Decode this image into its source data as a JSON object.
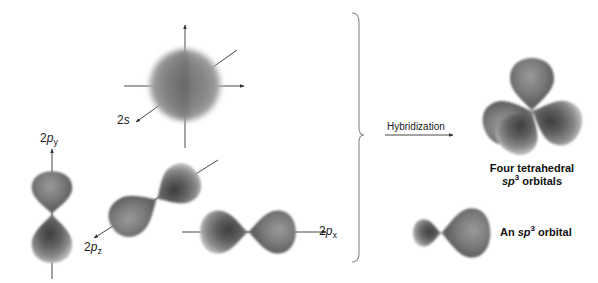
{
  "diagram": {
    "type": "orbital-hybridization",
    "colors": {
      "orbital_dark": "#4a4a4a",
      "orbital_mid": "#7a7a7a",
      "orbital_light": "#b5b5b5",
      "axis_line": "#333333",
      "brace": "#8a8a8a",
      "text": "#1a1a1a"
    },
    "left_group": {
      "orbitals": [
        {
          "id": "2s",
          "shape": "sphere",
          "label_main": "2",
          "label_italic": "s",
          "label_sub": ""
        },
        {
          "id": "2py",
          "shape": "dumbbell-vertical",
          "label_main": "2",
          "label_italic": "p",
          "label_sub": "y"
        },
        {
          "id": "2pz",
          "shape": "dumbbell-diagonal",
          "label_main": "2",
          "label_italic": "p",
          "label_sub": "z"
        },
        {
          "id": "2px",
          "shape": "dumbbell-horizontal",
          "label_main": "2",
          "label_italic": "p",
          "label_sub": "x"
        }
      ]
    },
    "arrow": {
      "label": "Hybridization"
    },
    "right_group": {
      "tetrahedral": {
        "caption_line1": "Four tetrahedral",
        "caption_line2_italic": "sp",
        "caption_line2_sup": "3",
        "caption_line2_rest": " orbitals"
      },
      "single": {
        "caption_prefix": "An ",
        "caption_italic": "sp",
        "caption_sup": "3",
        "caption_rest": " orbital"
      }
    }
  }
}
